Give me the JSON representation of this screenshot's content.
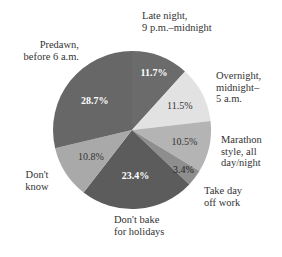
{
  "chart_data": {
    "type": "pie",
    "title": "",
    "start_angle_deg": 0,
    "direction": "clockwise",
    "center": [
      132,
      130
    ],
    "radius": 79,
    "slices": [
      {
        "label": "Late night, 9 p.m.–midnight",
        "value": 11.7,
        "display": "11.7%",
        "color": "#6b6b6b",
        "text_color": "#ffffff",
        "label_lines": [
          "Late night,",
          "9 p.m.–midnight"
        ]
      },
      {
        "label": "Overnight, midnight–5 a.m.",
        "value": 11.5,
        "display": "11.5%",
        "color": "#e2e2e2",
        "text_color": "#333333",
        "label_lines": [
          "Overnight,",
          "midnight–",
          "5 a.m."
        ]
      },
      {
        "label": "Marathon style, all day/night",
        "value": 10.5,
        "display": "10.5%",
        "color": "#b4b4b4",
        "text_color": "#333333",
        "label_lines": [
          "Marathon",
          "style, all",
          "day/night"
        ]
      },
      {
        "label": "Take day off work",
        "value": 3.4,
        "display": "3.4%",
        "color": "#8e8e8e",
        "text_color": "#222222",
        "label_lines": [
          "Take day",
          "off work"
        ]
      },
      {
        "label": "Don't bake for holidays",
        "value": 23.4,
        "display": "23.4%",
        "color": "#5c5c5c",
        "text_color": "#ffffff",
        "label_lines": [
          "Don't bake",
          "for holidays"
        ]
      },
      {
        "label": "Don't know",
        "value": 10.8,
        "display": "10.8%",
        "color": "#a9a9a9",
        "text_color": "#333333",
        "label_lines": [
          "Don't",
          "know"
        ]
      },
      {
        "label": "Predawn, before 6 a.m.",
        "value": 28.7,
        "display": "28.7%",
        "color": "#676767",
        "text_color": "#ffffff",
        "label_lines": [
          "Predawn,",
          "before 6 a.m."
        ]
      }
    ],
    "legend": "none (direct labels)",
    "grid": false
  },
  "labels": {
    "late_night": [
      "Late night,",
      "9 p.m.–midnight"
    ],
    "overnight": [
      "Overnight,",
      "midnight–",
      "5 a.m."
    ],
    "marathon": [
      "Marathon",
      "style, all",
      "day/night"
    ],
    "take_day": [
      "Take day",
      "off work"
    ],
    "dont_bake": [
      "Don't bake",
      "for holidays"
    ],
    "dont_know": [
      "Don't",
      "know"
    ],
    "predawn": [
      "Predawn,",
      "before 6 a.m."
    ]
  }
}
